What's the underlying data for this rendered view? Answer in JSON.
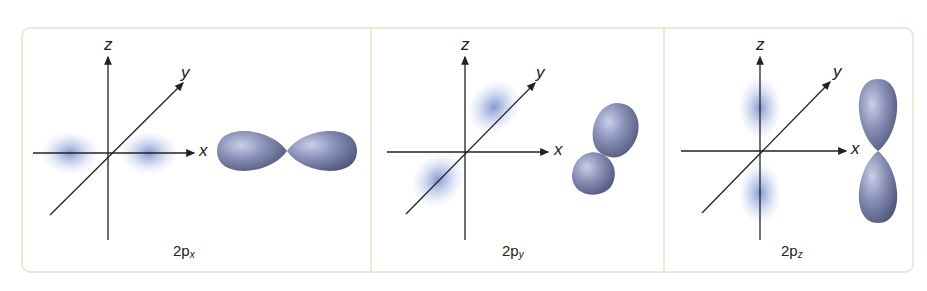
{
  "figure": {
    "panels": [
      {
        "id": "px",
        "caption_main": "2p",
        "caption_sub": "x",
        "axes": {
          "x": "x",
          "y": "y",
          "z": "z"
        },
        "orientation": "along x-axis"
      },
      {
        "id": "py",
        "caption_main": "2p",
        "caption_sub": "y",
        "axes": {
          "x": "x",
          "y": "y",
          "z": "z"
        },
        "orientation": "along y-axis"
      },
      {
        "id": "pz",
        "caption_main": "2p",
        "caption_sub": "z",
        "axes": {
          "x": "x",
          "y": "y",
          "z": "z"
        },
        "orientation": "along z-axis"
      }
    ],
    "colors": {
      "border": "#e6ecd6",
      "axis": "#222222",
      "cloud": "#6f86c8",
      "lobe_dark": "#5c6285",
      "lobe_light": "#b8bfdc"
    }
  }
}
